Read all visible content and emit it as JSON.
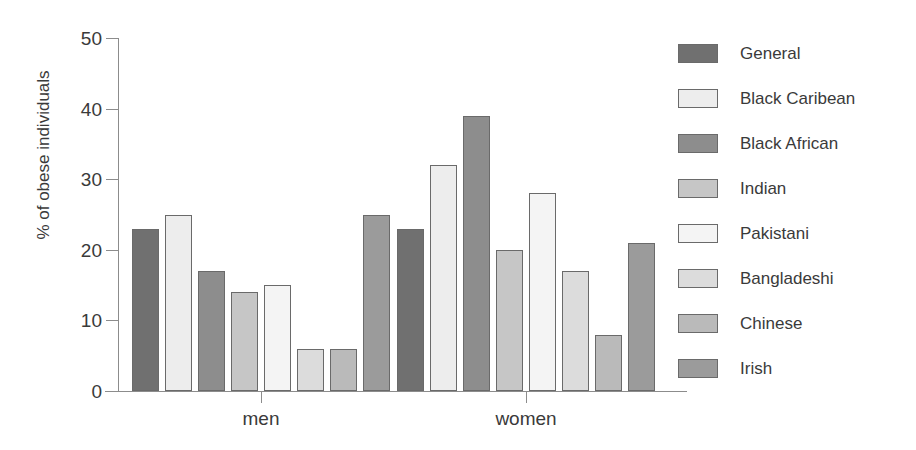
{
  "chart_data": {
    "type": "bar",
    "title": "",
    "xlabel": "",
    "ylabel": "% of obese individuals",
    "ylim": [
      0,
      50
    ],
    "yticks": [
      0,
      10,
      20,
      30,
      40,
      50
    ],
    "grid": false,
    "legend_position": "right",
    "categories": [
      "men",
      "women"
    ],
    "series": [
      {
        "name": "General",
        "values": [
          23,
          23
        ],
        "color": "#707070"
      },
      {
        "name": "Black Caribean",
        "values": [
          25,
          32
        ],
        "color": "#ededed"
      },
      {
        "name": "Black African",
        "values": [
          17,
          39
        ],
        "color": "#8d8d8d"
      },
      {
        "name": "Indian",
        "values": [
          14,
          20
        ],
        "color": "#c6c6c6"
      },
      {
        "name": "Pakistani",
        "values": [
          15,
          28
        ],
        "color": "#f4f4f4"
      },
      {
        "name": "Bangladeshi",
        "values": [
          6,
          17
        ],
        "color": "#dcdcdc"
      },
      {
        "name": "Chinese",
        "values": [
          6,
          8
        ],
        "color": "#bababa"
      },
      {
        "name": "Irish",
        "values": [
          25,
          21
        ],
        "color": "#9b9b9b"
      }
    ]
  },
  "axis": {
    "y_title": "% of obese individuals",
    "y_tick_labels": [
      "50",
      "40",
      "30",
      "20",
      "10",
      "0"
    ],
    "x_tick_labels": [
      "men",
      "women"
    ]
  },
  "legend": {
    "entries": [
      {
        "label": "General"
      },
      {
        "label": "Black Caribean"
      },
      {
        "label": "Black African"
      },
      {
        "label": "Indian"
      },
      {
        "label": "Pakistani"
      },
      {
        "label": "Bangladeshi"
      },
      {
        "label": "Chinese"
      },
      {
        "label": "Irish"
      }
    ]
  },
  "colors": {
    "axis": "#8c8c8c",
    "bar_outline": "#6a6a6a",
    "text": "#3a3a3a",
    "background": "#ffffff"
  }
}
